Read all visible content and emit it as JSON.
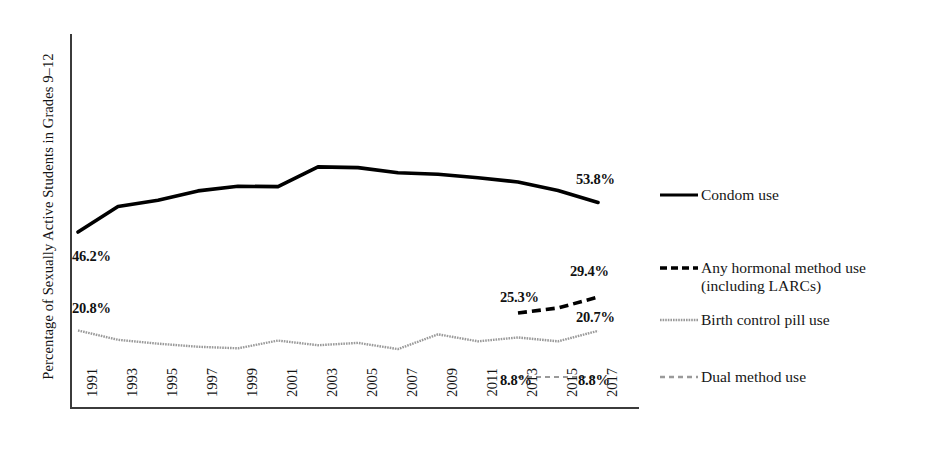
{
  "figure": {
    "y_axis_title": "Percentage of Sexually Active Students in Grades 9–12"
  },
  "chart_data": {
    "type": "line",
    "title": "",
    "xlabel": "",
    "ylabel": "Percentage of Sexually Active Students in Grades 9–12",
    "grid": false,
    "legend_position": "right",
    "xlim": [
      1991,
      2017
    ],
    "ylim": [
      0,
      100
    ],
    "categories": [
      1991,
      1993,
      1995,
      1997,
      1999,
      2001,
      2003,
      2005,
      2007,
      2009,
      2011,
      2013,
      2015,
      2017
    ],
    "tick_labels": [
      "1991",
      "1993",
      "1995",
      "1997",
      "1999",
      "2001",
      "2003",
      "2005",
      "2007",
      "2009",
      "2011",
      "2013",
      "2015",
      "2017"
    ],
    "series": [
      {
        "name": "Condom use",
        "style": "solid",
        "color": "#000000",
        "x": [
          1991,
          1993,
          1995,
          1997,
          1999,
          2001,
          2003,
          2005,
          2007,
          2009,
          2011,
          2013,
          2015,
          2017
        ],
        "values": [
          46.2,
          52.8,
          54.4,
          56.8,
          58.0,
          57.9,
          63.0,
          62.8,
          61.5,
          61.1,
          60.2,
          59.1,
          56.9,
          53.8
        ]
      },
      {
        "name": "Any hormonal method use (including LARCs)",
        "style": "dashed",
        "color": "#000000",
        "x": [
          2013,
          2015,
          2017
        ],
        "values": [
          25.3,
          26.6,
          29.4
        ]
      },
      {
        "name": "Birth control pill use",
        "style": "fine-dotted",
        "color": "#9a9a9a",
        "x": [
          1991,
          1993,
          1995,
          1997,
          1999,
          2001,
          2003,
          2005,
          2007,
          2009,
          2011,
          2013,
          2015,
          2017
        ],
        "values": [
          20.8,
          18.4,
          17.4,
          16.6,
          16.2,
          18.2,
          17.0,
          17.6,
          16.0,
          19.8,
          18.0,
          19.0,
          18.0,
          20.7
        ]
      },
      {
        "name": "Dual method use",
        "style": "grey-dashed",
        "color": "#9a9a9a",
        "x": [
          2013,
          2015,
          2017
        ],
        "values": [
          8.8,
          8.8,
          8.8
        ]
      }
    ],
    "annotations": [
      {
        "id": "ann-condom-1991",
        "text": "46.2%",
        "series": "Condom use",
        "x": 1991,
        "value": 46.2
      },
      {
        "id": "ann-condom-2017",
        "text": "53.8%",
        "series": "Condom use",
        "x": 2017,
        "value": 53.8
      },
      {
        "id": "ann-hormonal-2013",
        "text": "25.3%",
        "series": "Any hormonal method use (including LARCs)",
        "x": 2013,
        "value": 25.3
      },
      {
        "id": "ann-hormonal-2017",
        "text": "29.4%",
        "series": "Any hormonal method use (including LARCs)",
        "x": 2017,
        "value": 29.4
      },
      {
        "id": "ann-pill-1991",
        "text": "20.8%",
        "series": "Birth control pill use",
        "x": 1991,
        "value": 20.8
      },
      {
        "id": "ann-pill-2017",
        "text": "20.7%",
        "series": "Birth control pill use",
        "x": 2017,
        "value": 20.7
      },
      {
        "id": "ann-dual-2013",
        "text": "8.8%",
        "series": "Dual method use",
        "x": 2013,
        "value": 8.8
      },
      {
        "id": "ann-dual-2017",
        "text": "8.8%",
        "series": "Dual method use",
        "x": 2017,
        "value": 8.8
      }
    ],
    "legend": [
      {
        "label": "Condom use",
        "style": "solid",
        "color": "#000000"
      },
      {
        "label": "Any hormonal method use\n(including LARCs)",
        "style": "dashed",
        "color": "#000000"
      },
      {
        "label": "Birth control pill use",
        "style": "fine-dotted",
        "color": "#9a9a9a"
      },
      {
        "label": "Dual method use",
        "style": "grey-dashed",
        "color": "#9a9a9a"
      }
    ]
  }
}
